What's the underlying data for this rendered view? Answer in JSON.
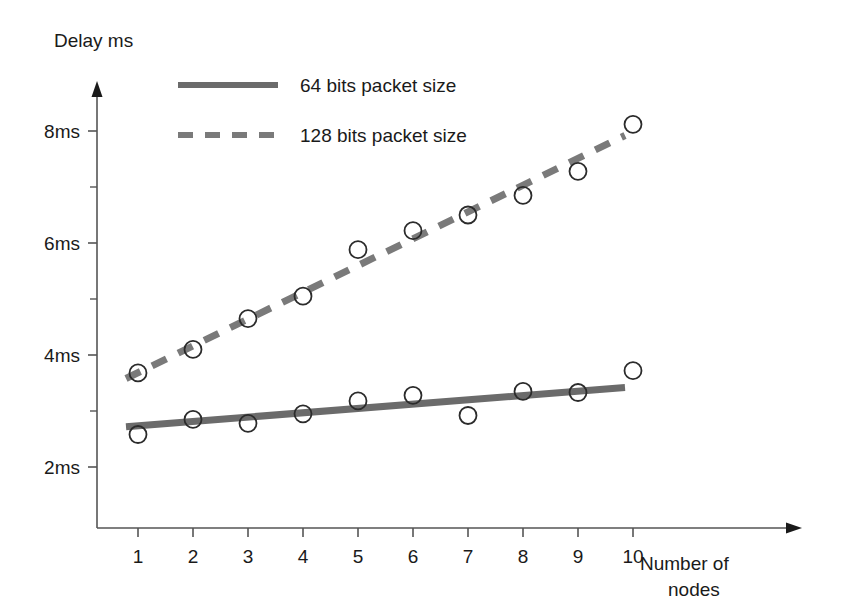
{
  "chart_data": {
    "type": "line",
    "title": "",
    "ylabel": "Delay ms",
    "xlabel": "Number of nodes",
    "xlabel_line1": "Number of",
    "xlabel_line2": "nodes",
    "categories": [
      1,
      2,
      3,
      4,
      5,
      6,
      7,
      8,
      9,
      10
    ],
    "x": [
      1,
      2,
      3,
      4,
      5,
      6,
      7,
      8,
      9,
      10
    ],
    "xtick_labels": [
      "1",
      "2",
      "3",
      "4",
      "5",
      "6",
      "7",
      "8",
      "9",
      "10"
    ],
    "ytick_labels": [
      "2ms",
      "4ms",
      "6ms",
      "8ms"
    ],
    "ytick_values": [
      2,
      4,
      6,
      8
    ],
    "yminor_values": [
      3,
      5,
      7
    ],
    "xlim": [
      0,
      11
    ],
    "ylim": [
      1,
      8.8
    ],
    "grid": false,
    "legend_position": "top-left",
    "series": [
      {
        "name": "64 bits packet size",
        "style": "solid",
        "color": "#6b6b6b",
        "marker": "open-circle",
        "values": [
          2.58,
          2.85,
          2.78,
          2.95,
          3.18,
          3.28,
          2.92,
          3.35,
          3.33,
          3.72
        ],
        "fit_start": 2.72,
        "fit_end": 3.42
      },
      {
        "name": "128 bits packet size",
        "style": "dashed",
        "color": "#7a7a7a",
        "marker": "open-circle",
        "values": [
          3.68,
          4.1,
          4.65,
          5.05,
          5.88,
          6.22,
          6.5,
          6.85,
          7.28,
          8.12
        ],
        "fit_start": 3.58,
        "fit_end": 7.92
      }
    ]
  },
  "legend": {
    "items": [
      {
        "label": "64 bits packet size",
        "style": "solid"
      },
      {
        "label": "128 bits packet size",
        "style": "dashed"
      }
    ]
  },
  "colors": {
    "axis": "#555555",
    "series_64": "#6b6b6b",
    "series_128": "#7a7a7a",
    "text": "#1a1a1a"
  }
}
